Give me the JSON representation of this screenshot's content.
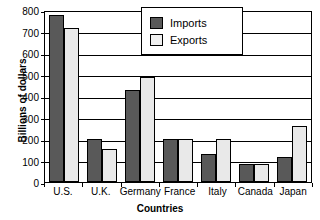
{
  "chart_data": {
    "type": "bar",
    "title": "",
    "xlabel": "Countries",
    "ylabel": "Billions of dollars",
    "categories": [
      "U.S.",
      "U.K.",
      "Germany",
      "France",
      "Italy",
      "Canada",
      "Japan"
    ],
    "series": [
      {
        "name": "Imports",
        "color": "#595959",
        "values": [
          775,
          202,
          430,
          202,
          128,
          84,
          115
        ]
      },
      {
        "name": "Exports",
        "color": "#e9e9e9",
        "values": [
          715,
          152,
          490,
          202,
          202,
          84,
          262
        ]
      }
    ],
    "ylim": [
      0,
      800
    ],
    "yticks": [
      0,
      100,
      200,
      300,
      400,
      500,
      600,
      700,
      800
    ],
    "ytick_labels": [
      "0",
      "100",
      "200",
      "300",
      "400",
      "500",
      "600",
      "700",
      "800"
    ],
    "grid": true,
    "grid_axis": "y",
    "legend_position": "top-right-inside",
    "legend_entries": [
      "Imports",
      "Exports"
    ]
  }
}
